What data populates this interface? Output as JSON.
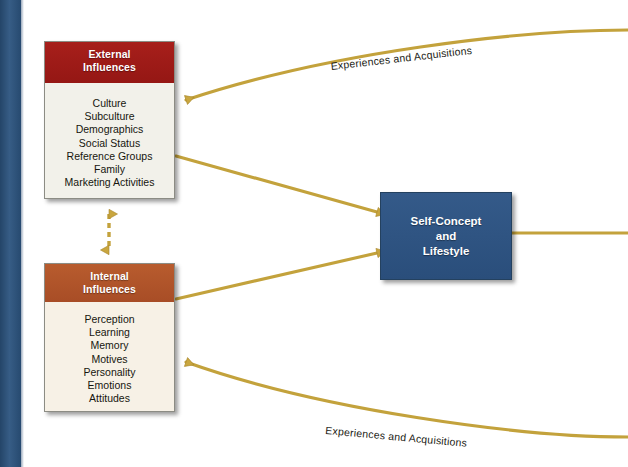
{
  "diagram": {
    "accent_gold": "#c3a23c",
    "spine_color": "#2c547f"
  },
  "external_influences": {
    "header_line_1": "External",
    "header_line_2": "Influences",
    "header_color": "#9e1b18",
    "items": [
      "Culture",
      "Subculture",
      "Demographics",
      "Social Status",
      "Reference Groups",
      "Family",
      "Marketing Activities"
    ]
  },
  "internal_influences": {
    "header_line_1": "Internal",
    "header_line_2": "Influences",
    "header_color": "#b0542a",
    "items": [
      "Perception",
      "Learning",
      "Memory",
      "Motives",
      "Personality",
      "Emotions",
      "Attitudes"
    ]
  },
  "self_concept": {
    "line_1": "Self-Concept",
    "line_2": "and",
    "line_3": "Lifestyle",
    "box_color": "#2e5584"
  },
  "flows": {
    "top_label": "Experiences and Acquisitions",
    "bottom_label": "Experiences and Acquisitions"
  }
}
